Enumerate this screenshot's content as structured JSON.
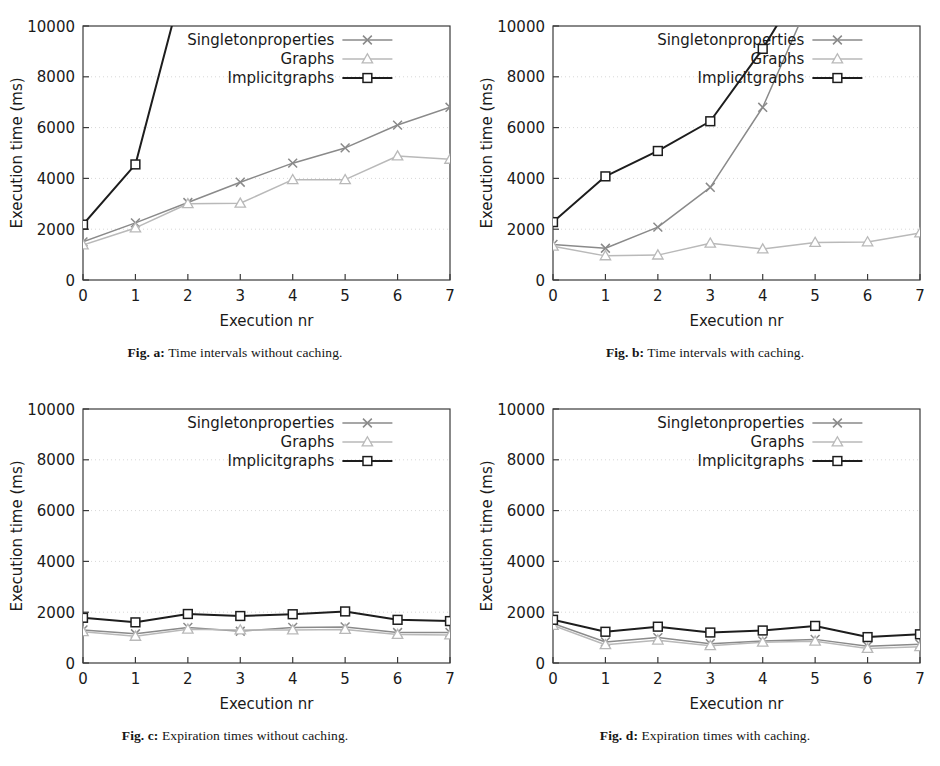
{
  "figure": {
    "axis_labels": {
      "x": "Execution nr",
      "y": "Execution time (ms)"
    },
    "y_ticks": [
      "0",
      "2000",
      "4000",
      "6000",
      "8000",
      "10000"
    ],
    "x_ticks": [
      "0",
      "1",
      "2",
      "3",
      "4",
      "5",
      "6",
      "7"
    ],
    "series_names": {
      "singleton": "Singletonproperties",
      "graphs": "Graphs",
      "implicit": "Implicitgraphs"
    },
    "colors": {
      "singleton": "#8a8a8a",
      "graphs": "#b9b9b9",
      "implicit": "#1d1d1d",
      "axis": "#3a3a3a",
      "grid": "#d8d8d8"
    },
    "markers": {
      "singleton": "cross",
      "graphs": "triangle",
      "implicit": "square"
    }
  },
  "panels": [
    {
      "id": "a",
      "caption_label": "Fig. a:",
      "caption_text": "Time intervals without caching.",
      "chart_data": {
        "type": "line",
        "title": "Time intervals without caching",
        "xlabel": "Execution nr",
        "ylabel": "Execution time (ms)",
        "xlim": [
          0,
          7
        ],
        "ylim": [
          0,
          10000
        ],
        "grid": true,
        "legend": "top-center",
        "x": [
          0,
          1,
          2,
          3,
          4,
          5,
          6,
          7
        ],
        "series": [
          {
            "name": "Singletonproperties",
            "values": [
              1500,
              2250,
              3050,
              3850,
              4600,
              5200,
              6100,
              6800
            ]
          },
          {
            "name": "Graphs",
            "values": [
              1380,
              2050,
              3000,
              3020,
              3950,
              3950,
              4880,
              4750
            ]
          },
          {
            "name": "Implicitgraphs",
            "values": [
              2180,
              4550,
              12400,
              20000,
              27000,
              34000,
              41000,
              48000
            ]
          }
        ]
      }
    },
    {
      "id": "b",
      "caption_label": "Fig. b:",
      "caption_text": "Time intervals with caching.",
      "chart_data": {
        "type": "line",
        "title": "Time intervals with caching",
        "xlabel": "Execution nr",
        "ylabel": "Execution time (ms)",
        "xlim": [
          0,
          7
        ],
        "ylim": [
          0,
          10000
        ],
        "grid": true,
        "legend": "top-center",
        "x": [
          0,
          1,
          2,
          3,
          4,
          5,
          6,
          7
        ],
        "series": [
          {
            "name": "Singletonproperties",
            "values": [
              1400,
              1250,
              2080,
              3650,
              6800,
              11500,
              16000,
              20500
            ]
          },
          {
            "name": "Graphs",
            "values": [
              1330,
              950,
              980,
              1450,
              1220,
              1480,
              1500,
              1850
            ]
          },
          {
            "name": "Implicitgraphs",
            "values": [
              2280,
              4080,
              5080,
              6250,
              9100,
              12500,
              16000,
              19500
            ]
          }
        ]
      }
    },
    {
      "id": "c",
      "caption_label": "Fig. c:",
      "caption_text": "Expiration times without caching.",
      "chart_data": {
        "type": "line",
        "title": "Expiration times without caching",
        "xlabel": "Execution nr",
        "ylabel": "Execution time (ms)",
        "xlim": [
          0,
          7
        ],
        "ylim": [
          0,
          10000
        ],
        "grid": true,
        "legend": "top-center",
        "x": [
          0,
          1,
          2,
          3,
          4,
          5,
          6,
          7
        ],
        "series": [
          {
            "name": "Singletonproperties",
            "values": [
              1300,
              1150,
              1400,
              1250,
              1400,
              1420,
              1200,
              1200
            ]
          },
          {
            "name": "Graphs",
            "values": [
              1230,
              1050,
              1330,
              1300,
              1300,
              1320,
              1120,
              1100
            ]
          },
          {
            "name": "Implicitgraphs",
            "values": [
              1780,
              1600,
              1930,
              1850,
              1920,
              2030,
              1700,
              1650
            ]
          }
        ]
      }
    },
    {
      "id": "d",
      "caption_label": "Fig. d:",
      "caption_text": "Expiration times with caching.",
      "chart_data": {
        "type": "line",
        "title": "Expiration times with caching",
        "xlabel": "Execution nr",
        "ylabel": "Execution time (ms)",
        "xlim": [
          0,
          7
        ],
        "ylim": [
          0,
          10000
        ],
        "grid": true,
        "legend": "top-center",
        "x": [
          0,
          1,
          2,
          3,
          4,
          5,
          6,
          7
        ],
        "series": [
          {
            "name": "Singletonproperties",
            "values": [
              1560,
              830,
              1000,
              760,
              870,
              930,
              660,
              740
            ]
          },
          {
            "name": "Graphs",
            "values": [
              1480,
              720,
              900,
              680,
              820,
              860,
              570,
              640
            ]
          },
          {
            "name": "Implicitgraphs",
            "values": [
              1700,
              1230,
              1430,
              1200,
              1280,
              1460,
              1020,
              1130
            ]
          }
        ]
      }
    }
  ]
}
